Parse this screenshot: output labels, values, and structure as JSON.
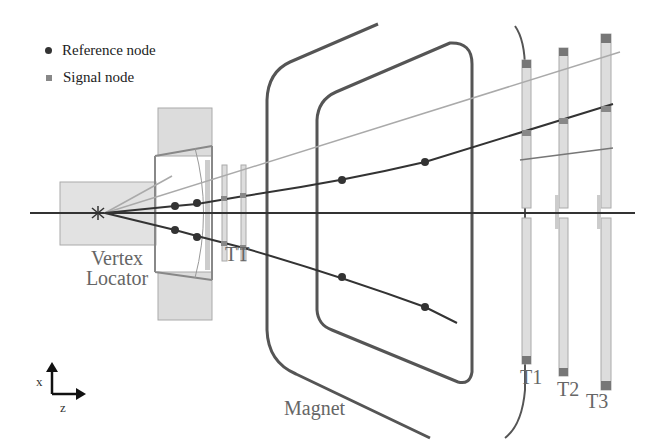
{
  "legend": {
    "items": [
      {
        "marker": "circle",
        "label": "Reference node",
        "color": "#333333"
      },
      {
        "marker": "square",
        "label": "Signal node",
        "color": "#888888"
      }
    ]
  },
  "labels": {
    "vertex_locator": "Vertex\nLocator",
    "vertex_line1": "Vertex",
    "vertex_line2": "Locator",
    "tt": "TT",
    "magnet": "Magnet",
    "t1": "T1",
    "t2": "T2",
    "t3": "T3"
  },
  "axes": {
    "vertical": "x",
    "horizontal": "z"
  },
  "colors": {
    "track_dark": "#333333",
    "track_light": "#aaaaaa",
    "detector_fill": "#dcdcdc",
    "detector_stroke": "#999999",
    "magnet_stroke": "#555555"
  }
}
